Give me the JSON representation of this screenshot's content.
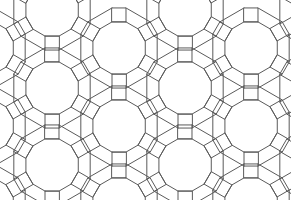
{
  "figure": {
    "type": "geometric tiling",
    "caption_fragment": "",
    "line_color": "#5a5a5a",
    "background": "#ffffff",
    "width": 291,
    "height": 200,
    "shapes": [
      "dodecagon",
      "hexagon",
      "square",
      "triangle"
    ],
    "edge_length": 14,
    "dodecagon_circumradius": 27,
    "lattice": {
      "origin": [
        119,
        48
      ],
      "a": [
        133,
        0
      ],
      "b": [
        66,
        39
      ]
    },
    "dodecagon_centers": [
      [
        119,
        48
      ],
      [
        251,
        48
      ],
      [
        -13,
        48
      ],
      [
        52,
        88
      ],
      [
        185,
        88
      ],
      [
        318,
        88
      ],
      [
        119,
        126
      ],
      [
        251,
        126
      ],
      [
        -13,
        126
      ],
      [
        52,
        165
      ],
      [
        185,
        165
      ],
      [
        318,
        165
      ],
      [
        119,
        204
      ],
      [
        251,
        204
      ],
      [
        -13,
        204
      ],
      [
        52,
        10
      ],
      [
        185,
        10
      ],
      [
        318,
        10
      ]
    ]
  }
}
